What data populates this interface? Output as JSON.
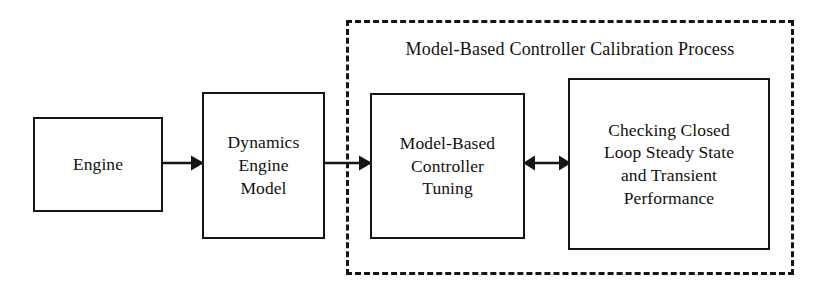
{
  "diagram": {
    "type": "block-flow-diagram",
    "background_color": "#ffffff",
    "line_color": "#151515",
    "text_color": "#111111",
    "nodes": [
      {
        "id": "engine",
        "label": "Engine"
      },
      {
        "id": "dynamics",
        "label": "Dynamics\nEngine\nModel"
      },
      {
        "id": "tuning",
        "label": "Model-Based\nController\nTuning"
      },
      {
        "id": "checking",
        "label": "Checking Closed\nLoop Steady State\nand Transient\nPerformance"
      }
    ],
    "group": {
      "id": "calibration-process",
      "title": "Model-Based Controller Calibration Process",
      "border_style": "dashed"
    },
    "connectors": [
      {
        "id": "engine-to-dynamics",
        "from": "engine",
        "to": "dynamics",
        "arrowheads": "single"
      },
      {
        "id": "dynamics-to-tuning",
        "from": "dynamics",
        "to": "tuning",
        "arrowheads": "single"
      },
      {
        "id": "tuning-checking",
        "from": "tuning",
        "to": "checking",
        "arrowheads": "double"
      }
    ]
  }
}
